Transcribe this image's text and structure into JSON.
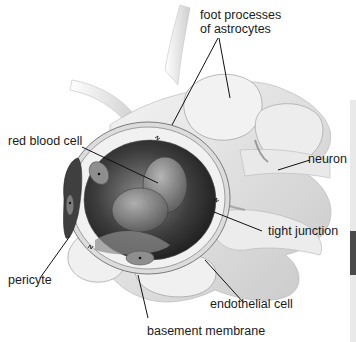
{
  "diagram": {
    "labels": {
      "foot_processes": [
        "foot processes",
        "of astrocytes"
      ],
      "red_blood_cell": "red blood cell",
      "neuron": "neuron",
      "tight_junction": "tight junction",
      "pericyte": "pericyte",
      "endothelial_cell": "endothelial cell",
      "basement_membrane": "basement membrane"
    },
    "colors": {
      "background": "#ffffff",
      "tissue_light": "#ececec",
      "tissue_mid": "#bdbdbd",
      "tissue_dark": "#5a5a5a",
      "lumen_dark": "#2a2a2a",
      "leader_line": "#111111",
      "edge_strip": "#e9e9e9",
      "edge_tab": "#4a4a4a"
    }
  }
}
